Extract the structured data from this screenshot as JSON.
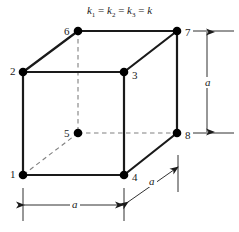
{
  "figure": {
    "title": "k1 = k2 = k3 = k",
    "title_parts": {
      "k1": "k",
      "s1": "1",
      "k2": "k",
      "s2": "2",
      "k3": "k",
      "s3": "3",
      "k4": "k",
      "eq": "="
    },
    "width": 239,
    "height": 232,
    "background_color": "#ffffff",
    "stroke_color": "#1a1a1a",
    "dashed_color": "#808080",
    "node_color": "#000000"
  },
  "nodes": [
    {
      "label": "1",
      "x": 23,
      "y": 175,
      "label_x": 10,
      "label_y": 169
    },
    {
      "label": "2",
      "x": 23,
      "y": 72,
      "label_x": 10,
      "label_y": 66
    },
    {
      "label": "3",
      "x": 124,
      "y": 72,
      "label_x": 132,
      "label_y": 70
    },
    {
      "label": "4",
      "x": 124,
      "y": 175,
      "label_x": 132,
      "label_y": 172
    },
    {
      "label": "5",
      "x": 78,
      "y": 133,
      "label_x": 64,
      "label_y": 128
    },
    {
      "label": "6",
      "x": 78,
      "y": 31,
      "label_x": 64,
      "label_y": 26
    },
    {
      "label": "7",
      "x": 177,
      "y": 31,
      "label_x": 185,
      "label_y": 27
    },
    {
      "label": "8",
      "x": 177,
      "y": 133,
      "label_x": 185,
      "label_y": 130
    }
  ],
  "solid_edges": [
    {
      "name": "edge-1-2",
      "x1": 23,
      "y1": 175,
      "x2": 23,
      "y2": 72
    },
    {
      "name": "edge-2-3",
      "x1": 23,
      "y1": 72,
      "x2": 124,
      "y2": 72
    },
    {
      "name": "edge-3-4",
      "x1": 124,
      "y1": 72,
      "x2": 124,
      "y2": 175
    },
    {
      "name": "edge-4-1",
      "x1": 124,
      "y1": 175,
      "x2": 23,
      "y2": 175
    },
    {
      "name": "edge-6-7",
      "x1": 78,
      "y1": 31,
      "x2": 177,
      "y2": 31
    },
    {
      "name": "edge-7-8",
      "x1": 177,
      "y1": 31,
      "x2": 177,
      "y2": 133
    },
    {
      "name": "edge-2-6",
      "x1": 23,
      "y1": 72,
      "x2": 78,
      "y2": 31
    },
    {
      "name": "edge-3-7",
      "x1": 124,
      "y1": 72,
      "x2": 177,
      "y2": 31
    },
    {
      "name": "edge-4-8",
      "x1": 124,
      "y1": 175,
      "x2": 177,
      "y2": 133
    }
  ],
  "dashed_edges": [
    {
      "name": "edge-6-5",
      "x1": 78,
      "y1": 31,
      "x2": 78,
      "y2": 133
    },
    {
      "name": "edge-5-8",
      "x1": 78,
      "y1": 133,
      "x2": 177,
      "y2": 133
    },
    {
      "name": "edge-5-1",
      "x1": 78,
      "y1": 133,
      "x2": 23,
      "y2": 175
    }
  ],
  "dimensions": {
    "vertical": {
      "label": "a",
      "x": 207,
      "y_top": 31,
      "y_bottom": 133,
      "ext_top_x1": 193,
      "ext_top_x2": 234,
      "ext_top_y": 31,
      "ext_bottom_x1": 193,
      "ext_bottom_x2": 234,
      "ext_bottom_y": 133,
      "label_x": 203,
      "label_y": 77
    },
    "horizontal": {
      "label": "a",
      "y": 205,
      "x_left": 23,
      "x_right": 124,
      "ext_left_x": 23,
      "ext_left_y1": 188,
      "ext_left_y2": 221,
      "ext_right_x": 124,
      "ext_right_y1": 188,
      "ext_right_y2": 221,
      "label_x": 70,
      "label_y": 199
    },
    "diagonal": {
      "label": "a",
      "x1": 128,
      "y1": 202,
      "x2": 178,
      "y2": 167,
      "ext_x": 178,
      "ext_y1": 155,
      "ext_y2": 192,
      "label_x": 147,
      "label_y": 176
    }
  }
}
